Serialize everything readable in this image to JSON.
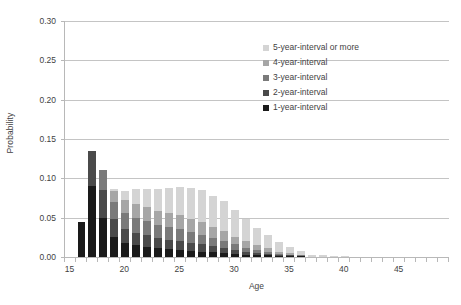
{
  "chart_data": {
    "type": "bar",
    "stacked": true,
    "title": "",
    "xlabel": "Age",
    "ylabel": "Probability",
    "xlim": [
      15,
      49
    ],
    "ylim": [
      0.0,
      0.3
    ],
    "ytick_values": [
      0.0,
      0.05,
      0.1,
      0.15,
      0.2,
      0.25,
      0.3
    ],
    "ytick_labels": [
      "0.00",
      "0.05",
      "0.10",
      "0.15",
      "0.20",
      "0.25",
      "0.30"
    ],
    "xtick_values": [
      15,
      20,
      25,
      30,
      35,
      40,
      45
    ],
    "xtick_labels": [
      "15",
      "20",
      "25",
      "30",
      "35",
      "40",
      "45"
    ],
    "xtick_minor_step": 1,
    "grid": "horizontal",
    "legend_position": "upper-right-inside",
    "categories": [
      15,
      16,
      17,
      18,
      19,
      20,
      21,
      22,
      23,
      24,
      25,
      26,
      27,
      28,
      29,
      30,
      31,
      32,
      33,
      34,
      35,
      36,
      37,
      38,
      39,
      40,
      41,
      42,
      43,
      44,
      45,
      46,
      47,
      48,
      49
    ],
    "series": [
      {
        "name": "1-year-interval",
        "color": "#1a1a1a",
        "values": [
          0.0,
          0.045,
          0.09,
          0.05,
          0.026,
          0.018,
          0.015,
          0.013,
          0.011,
          0.01,
          0.009,
          0.008,
          0.007,
          0.006,
          0.005,
          0.004,
          0.003,
          0.002,
          0.002,
          0.001,
          0.001,
          0.001,
          0.0,
          0.0,
          0.0,
          0.0,
          0.0,
          0.0,
          0.0,
          0.0,
          0.0,
          0.0,
          0.0,
          0.0,
          0.0
        ]
      },
      {
        "name": "2-year-interval",
        "color": "#4a4a4a",
        "values": [
          0.0,
          0.0,
          0.045,
          0.035,
          0.022,
          0.018,
          0.016,
          0.015,
          0.013,
          0.012,
          0.011,
          0.01,
          0.009,
          0.008,
          0.007,
          0.005,
          0.004,
          0.003,
          0.002,
          0.001,
          0.001,
          0.0,
          0.0,
          0.0,
          0.0,
          0.0,
          0.0,
          0.0,
          0.0,
          0.0,
          0.0,
          0.0,
          0.0,
          0.0,
          0.0
        ]
      },
      {
        "name": "3-year-interval",
        "color": "#7a7a7a",
        "values": [
          0.0,
          0.0,
          0.0,
          0.025,
          0.022,
          0.02,
          0.019,
          0.018,
          0.017,
          0.016,
          0.015,
          0.014,
          0.012,
          0.01,
          0.009,
          0.007,
          0.005,
          0.004,
          0.003,
          0.002,
          0.001,
          0.001,
          0.0,
          0.0,
          0.0,
          0.0,
          0.0,
          0.0,
          0.0,
          0.0,
          0.0,
          0.0,
          0.0,
          0.0,
          0.0
        ]
      },
      {
        "name": "4-year-interval",
        "color": "#a6a6a6",
        "values": [
          0.0,
          0.0,
          0.0,
          0.0,
          0.014,
          0.017,
          0.018,
          0.018,
          0.018,
          0.018,
          0.018,
          0.017,
          0.016,
          0.014,
          0.012,
          0.01,
          0.008,
          0.006,
          0.004,
          0.003,
          0.002,
          0.001,
          0.0,
          0.0,
          0.0,
          0.0,
          0.0,
          0.0,
          0.0,
          0.0,
          0.0,
          0.0,
          0.0,
          0.0,
          0.0
        ]
      },
      {
        "name": "5-year-interval or more",
        "color": "#d4d4d4",
        "values": [
          0.0,
          0.0,
          0.0,
          0.0,
          0.002,
          0.011,
          0.018,
          0.023,
          0.028,
          0.032,
          0.036,
          0.039,
          0.041,
          0.04,
          0.038,
          0.034,
          0.028,
          0.022,
          0.017,
          0.012,
          0.008,
          0.005,
          0.003,
          0.002,
          0.001,
          0.001,
          0.0,
          0.0,
          0.0,
          0.0,
          0.0,
          0.0,
          0.0,
          0.0,
          0.0
        ]
      }
    ],
    "totals": [
      0.0,
      0.045,
      0.135,
      0.11,
      0.086,
      0.084,
      0.086,
      0.087,
      0.087,
      0.088,
      0.089,
      0.088,
      0.085,
      0.078,
      0.071,
      0.06,
      0.048,
      0.037,
      0.028,
      0.019,
      0.013,
      0.008,
      0.003,
      0.002,
      0.001,
      0.001,
      0.0,
      0.0,
      0.0,
      0.0,
      0.0,
      0.0,
      0.0,
      0.0,
      0.0
    ]
  },
  "legend": {
    "items": [
      {
        "label": "5-year-interval or more",
        "color": "#d4d4d4"
      },
      {
        "label": "4-year-interval",
        "color": "#a6a6a6"
      },
      {
        "label": "3-year-interval",
        "color": "#7a7a7a"
      },
      {
        "label": "2-year-interval",
        "color": "#4a4a4a"
      },
      {
        "label": "1-year-interval",
        "color": "#1a1a1a"
      }
    ]
  },
  "axes": {
    "y_title": "Probability",
    "x_title": "Age"
  },
  "style": {
    "gridline_color": "#c4c4c4",
    "axis_color": "#b8b8b8",
    "text_color": "#3f3f3f",
    "background": "#ffffff"
  }
}
